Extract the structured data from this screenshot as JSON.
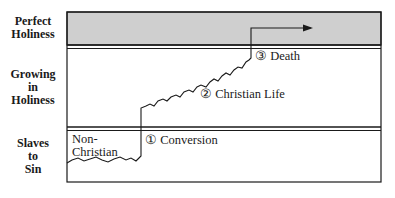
{
  "diagram": {
    "row_labels": {
      "perfect": [
        "Perfect",
        "Holiness"
      ],
      "growing": [
        "Growing",
        "in",
        "Holiness"
      ],
      "slaves": [
        "Slaves",
        "to",
        "Sin"
      ]
    },
    "annotations": {
      "non_christian": [
        "Non-",
        "Christian"
      ],
      "conversion": "① Conversion",
      "christian_life": "② Christian Life",
      "death": "③ Death"
    },
    "colors": {
      "band_fill": "#cfcfcf",
      "line": "#1a1a1a"
    }
  }
}
